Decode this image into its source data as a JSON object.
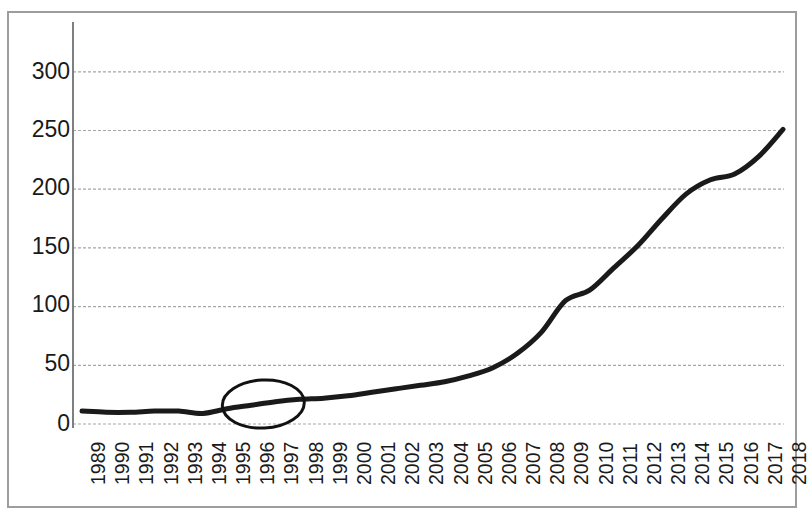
{
  "chart_data": {
    "type": "line",
    "title": "",
    "subtitle": "",
    "xlabel": "",
    "ylabel": "",
    "categories": [
      "1989",
      "1990",
      "1991",
      "1992",
      "1993",
      "1994",
      "1995",
      "1996",
      "1997",
      "1998",
      "1999",
      "2000",
      "2001",
      "2002",
      "2003",
      "2004",
      "2005",
      "2006",
      "2007",
      "2008",
      "2009",
      "2010",
      "2011",
      "2012",
      "2013",
      "2014",
      "2015",
      "2016",
      "2017",
      "2018"
    ],
    "values": [
      11,
      10,
      10,
      11,
      11,
      9,
      13,
      16,
      19,
      21,
      22,
      24,
      27,
      30,
      33,
      36,
      41,
      48,
      60,
      78,
      105,
      114,
      133,
      152,
      175,
      196,
      208,
      213,
      228,
      251
    ],
    "series": [
      {
        "name": "series-1",
        "values": [
          11,
          10,
          10,
          11,
          11,
          9,
          13,
          16,
          19,
          21,
          22,
          24,
          27,
          30,
          33,
          36,
          41,
          48,
          60,
          78,
          105,
          114,
          133,
          152,
          175,
          196,
          208,
          213,
          228,
          251
        ],
        "color": "#1a1a1a",
        "line_width": 5
      }
    ],
    "ylim": [
      0,
      320
    ],
    "xlim": [
      "1989",
      "2018"
    ],
    "ytick_values": [
      0,
      50,
      100,
      150,
      200,
      250,
      300
    ],
    "ytick_labels": [
      "0",
      "50",
      "100",
      "150",
      "200",
      "250",
      "300"
    ],
    "xtick_labels": [
      "1989",
      "1990",
      "1991",
      "1992",
      "1993",
      "1994",
      "1995",
      "1996",
      "1997",
      "1998",
      "1999",
      "2000",
      "2001",
      "2002",
      "2003",
      "2004",
      "2005",
      "2006",
      "2007",
      "2008",
      "2009",
      "2010",
      "2011",
      "2012",
      "2013",
      "2014",
      "2015",
      "2016",
      "2017",
      "2018"
    ],
    "grid": {
      "horizontal": true,
      "vertical": false,
      "style": "dashed",
      "color": "#a6a6a6"
    },
    "legend": {
      "visible": false,
      "position": "none",
      "entries": []
    },
    "annotations": [
      {
        "kind": "ellipse-highlight",
        "name": "highlight-ellipse-1996-1997",
        "covers_categories": [
          "1995",
          "1996",
          "1997",
          "1998"
        ],
        "center_year": "1996.5",
        "center_value": 17,
        "color": "#111111",
        "line_width": 3
      }
    ],
    "axis": {
      "left_spine": true,
      "bottom_spine": false,
      "spine_color": "#7f7f7f"
    },
    "frame": {
      "border_color": "#9d9d9d",
      "background": "#ffffff"
    }
  }
}
